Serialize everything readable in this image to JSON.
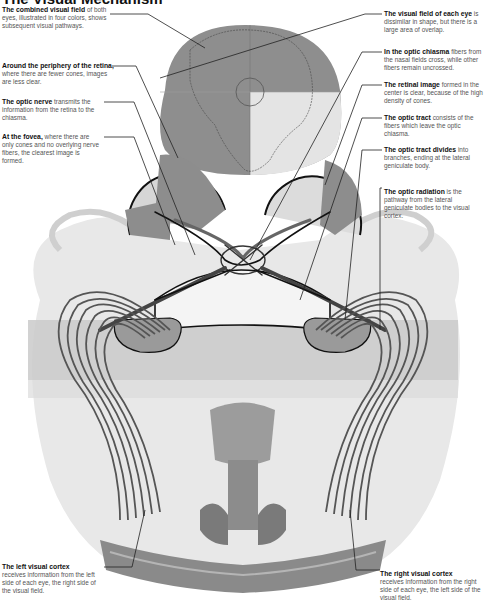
{
  "title": "The Visual Mechanism",
  "labels": {
    "combined_field": {
      "bold": "The combined visual field",
      "text": "of both eyes, illustrated in four colors, shows subsequent visual pathways."
    },
    "periphery": {
      "bold": "Around the periphery of the retina,",
      "text": "where there are fewer cones, images are less clear."
    },
    "optic_nerve": {
      "bold": "The optic nerve",
      "text": "transmits the information from the retina to the chiasma."
    },
    "fovea": {
      "bold": "At the fovea,",
      "text": "where there are only cones and no overlying nerve fibers, the clearest image is formed."
    },
    "field_each_eye": {
      "bold": "The visual field of each eye",
      "text": "is dissimilar in shape, but there is a large area of overlap."
    },
    "chiasma": {
      "bold": "In the optic chiasma",
      "text": "fibers from the nasal fields cross, while other fibers remain uncrossed."
    },
    "retinal_image": {
      "bold": "The retinal image",
      "text": "formed in the center is clear, because of the high density of cones."
    },
    "optic_tract": {
      "bold": "The optic tract",
      "text": "consists of the fibers which leave the optic chiasma."
    },
    "tract_divides": {
      "bold": "The optic tract divides",
      "text": "into branches, ending at the lateral geniculate body."
    },
    "optic_radiation": {
      "bold": "The optic radiation",
      "text": "is the pathway from the lateral geniculate bodies to the visual cortex."
    },
    "left_cortex": {
      "bold": "The left visual cortex",
      "text": "receives information from the left side of each eye, the right side of the visual field."
    },
    "right_cortex": {
      "bold": "The right visual cortex",
      "text": "receives information from the right side of each eye, the left side of the visual field."
    }
  },
  "colors": {
    "field_dark": "#8a8a8a",
    "field_light": "#e6e6e6",
    "brain_light": "#e4e4e4",
    "band": "#c9c9c9",
    "fiber": "#555555"
  }
}
